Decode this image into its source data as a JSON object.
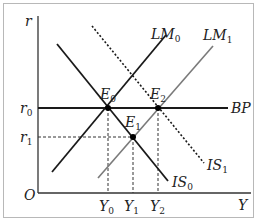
{
  "diagram": {
    "type": "IS-LM-BP",
    "axes": {
      "y_label": "r",
      "x_label": "Y",
      "origin_label": "O"
    },
    "y_ticks": [
      {
        "base": "r",
        "sub": "0"
      },
      {
        "base": "r",
        "sub": "1"
      }
    ],
    "x_ticks": [
      {
        "base": "Y",
        "sub": "0"
      },
      {
        "base": "Y",
        "sub": "1"
      },
      {
        "base": "Y",
        "sub": "2"
      }
    ],
    "curves": [
      {
        "id": "LM0",
        "base": "LM",
        "sub": "0",
        "style": "solid",
        "color": "#1a1a1a"
      },
      {
        "id": "LM1",
        "base": "LM",
        "sub": "1",
        "style": "solid",
        "color": "#7a7a7a"
      },
      {
        "id": "IS0",
        "base": "IS",
        "sub": "0",
        "style": "solid",
        "color": "#1a1a1a"
      },
      {
        "id": "IS1",
        "base": "IS",
        "sub": "1",
        "style": "dotted",
        "color": "#1a1a1a"
      },
      {
        "id": "BP",
        "base": "BP",
        "sub": "",
        "style": "solid",
        "color": "#1a1a1a"
      }
    ],
    "points": [
      {
        "id": "E0",
        "base": "E",
        "sub": "0"
      },
      {
        "id": "E1",
        "base": "E",
        "sub": "1"
      },
      {
        "id": "E2",
        "base": "E",
        "sub": "2"
      }
    ]
  }
}
